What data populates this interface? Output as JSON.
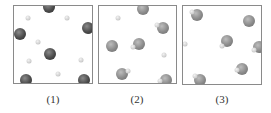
{
  "figure": {
    "panels": [
      {
        "label": "(1)",
        "box": {
          "x": 13,
          "y": 5,
          "w": 80,
          "h": 79
        },
        "atoms": [
          {
            "type": "big-dark",
            "x": 48,
            "y": 6
          },
          {
            "type": "big-dark",
            "x": 87,
            "y": 27
          },
          {
            "type": "big-dark",
            "x": 19,
            "y": 33
          },
          {
            "type": "big-dark",
            "x": 49,
            "y": 53
          },
          {
            "type": "big-dark",
            "x": 25,
            "y": 79
          },
          {
            "type": "big-dark",
            "x": 83,
            "y": 79
          },
          {
            "type": "small",
            "x": 27,
            "y": 17
          },
          {
            "type": "small",
            "x": 66,
            "y": 17
          },
          {
            "type": "small",
            "x": 37,
            "y": 41
          },
          {
            "type": "small",
            "x": 28,
            "y": 60
          },
          {
            "type": "small",
            "x": 80,
            "y": 59
          },
          {
            "type": "small",
            "x": 57,
            "y": 73
          }
        ]
      },
      {
        "label": "(2)",
        "box": {
          "x": 98,
          "y": 5,
          "w": 79,
          "h": 79
        },
        "atoms": [
          {
            "type": "big-gray",
            "x": 142,
            "y": 8
          },
          {
            "type": "big-gray",
            "x": 162,
            "y": 27
          },
          {
            "type": "big-gray",
            "x": 111,
            "y": 45
          },
          {
            "type": "big-gray",
            "x": 138,
            "y": 43
          },
          {
            "type": "big-gray",
            "x": 121,
            "y": 73
          },
          {
            "type": "big-gray",
            "x": 165,
            "y": 79
          },
          {
            "type": "small",
            "x": 117,
            "y": 17
          },
          {
            "type": "small",
            "x": 163,
            "y": 54
          },
          {
            "type": "small",
            "x": 156,
            "y": 24
          },
          {
            "type": "small",
            "x": 132,
            "y": 46
          },
          {
            "type": "small",
            "x": 127,
            "y": 70
          },
          {
            "type": "small",
            "x": 159,
            "y": 80
          }
        ]
      },
      {
        "label": "(3)",
        "box": {
          "x": 182,
          "y": 5,
          "w": 80,
          "h": 80
        },
        "atoms": [
          {
            "type": "big-gray",
            "x": 196,
            "y": 14
          },
          {
            "type": "big-gray",
            "x": 248,
            "y": 20
          },
          {
            "type": "big-gray",
            "x": 226,
            "y": 40
          },
          {
            "type": "big-gray",
            "x": 258,
            "y": 46
          },
          {
            "type": "big-gray",
            "x": 241,
            "y": 68
          },
          {
            "type": "big-gray",
            "x": 199,
            "y": 79
          },
          {
            "type": "small",
            "x": 191,
            "y": 11
          },
          {
            "type": "small",
            "x": 221,
            "y": 45
          },
          {
            "type": "small",
            "x": 253,
            "y": 49
          },
          {
            "type": "small",
            "x": 236,
            "y": 69
          },
          {
            "type": "small",
            "x": 194,
            "y": 75
          },
          {
            "type": "small",
            "x": 184,
            "y": 43
          }
        ]
      }
    ],
    "labels": [
      {
        "text": "(1)",
        "x": 53,
        "y": 93
      },
      {
        "text": "(2)",
        "x": 137,
        "y": 93
      },
      {
        "text": "(3)",
        "x": 222,
        "y": 93
      }
    ]
  },
  "colors": {
    "border": "#8a8a8a",
    "dark_atom": "#3c3c3c",
    "gray_atom": "#8a8a8a",
    "small_atom": "#cfcfcf",
    "label": "#333333"
  }
}
